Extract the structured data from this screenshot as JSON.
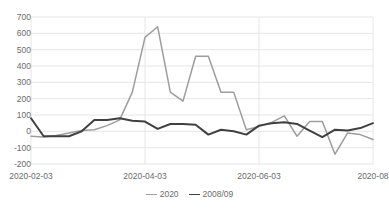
{
  "chart_data": {
    "type": "line",
    "title": "",
    "xlabel": "",
    "ylabel": "",
    "ylim": [
      -200,
      700
    ],
    "ytick_labels": [
      "700",
      "600",
      "500",
      "400",
      "300",
      "200",
      "100",
      "0",
      "-100",
      "-200"
    ],
    "yticks": [
      700,
      600,
      500,
      400,
      300,
      200,
      100,
      0,
      -100,
      -200
    ],
    "grid": true,
    "legend_position": "bottom-center",
    "x_index": [
      0,
      1,
      2,
      3,
      4,
      5,
      6,
      7,
      8,
      9,
      10,
      11,
      12,
      13,
      14,
      15,
      16,
      17,
      18,
      19,
      20,
      21,
      22,
      23,
      24,
      25,
      26,
      27
    ],
    "xtick_labels": [
      "2020-02-03",
      "2020-04-03",
      "2020-06-03",
      "2020-08"
    ],
    "xtick_positions": [
      0,
      9,
      18,
      27
    ],
    "series": [
      {
        "name": "2020",
        "color": "#9d9d9d",
        "values": [
          -30,
          -35,
          -25,
          -10,
          5,
          10,
          35,
          70,
          240,
          575,
          640,
          240,
          185,
          460,
          460,
          240,
          240,
          10,
          30,
          55,
          95,
          -30,
          60,
          60,
          -140,
          -10,
          -20,
          -50
        ]
      },
      {
        "name": "2008/09",
        "color": "#404040",
        "values": [
          80,
          -30,
          -30,
          -30,
          0,
          70,
          70,
          80,
          65,
          60,
          15,
          45,
          45,
          40,
          -20,
          10,
          0,
          -20,
          35,
          50,
          55,
          45,
          5,
          -35,
          10,
          5,
          20,
          50
        ]
      }
    ],
    "legend": [
      {
        "label": "2020",
        "color": "#9d9d9d"
      },
      {
        "label": "2008/09",
        "color": "#404040"
      }
    ],
    "colors": {
      "series_2020": "#9d9d9d",
      "series_2008_09": "#404040",
      "gridline": "#e3e3e3",
      "axis_text": "#6b6b6b",
      "background": "#ffffff"
    }
  }
}
